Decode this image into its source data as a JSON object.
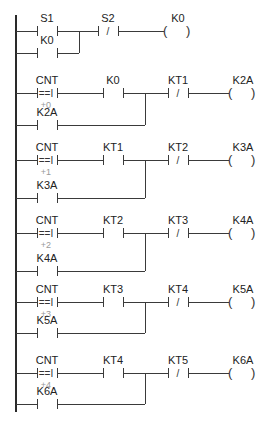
{
  "diagram": {
    "type": "ladder-logic",
    "colors": {
      "wire": "#3a3a3a",
      "text": "#222222",
      "annotation": "#9a9a9a"
    },
    "rail": {
      "x": 16,
      "y1": 15,
      "y2": 412
    },
    "rungs": [
      {
        "id": "rung-1",
        "main_y": 31,
        "branch_y": 53,
        "junction_x": 79,
        "elements": [
          {
            "kind": "contact_no",
            "label": "S1",
            "x": 37
          },
          {
            "kind": "contact_nc",
            "label": "S2",
            "x": 98
          },
          {
            "kind": "coil",
            "label": "K0",
            "x": 163
          }
        ],
        "branch": {
          "kind": "contact_no",
          "label": "K0",
          "x": 37
        }
      },
      {
        "id": "rung-2",
        "main_y": 93,
        "branch_y": 125,
        "junction_x": 145,
        "elements": [
          {
            "kind": "compare",
            "label": "CNT",
            "op": "==I",
            "operand": "+0",
            "x": 37
          },
          {
            "kind": "contact_no",
            "label": "K0",
            "x": 103
          },
          {
            "kind": "contact_nc",
            "label": "KT1",
            "x": 168
          },
          {
            "kind": "coil",
            "label": "K2A",
            "x": 228
          }
        ],
        "branch": {
          "kind": "contact_no",
          "label": "K2A",
          "x": 37
        }
      },
      {
        "id": "rung-3",
        "main_y": 160,
        "branch_y": 198,
        "junction_x": 145,
        "elements": [
          {
            "kind": "compare",
            "label": "CNT",
            "op": "==I",
            "operand": "+1",
            "x": 37
          },
          {
            "kind": "contact_no",
            "label": "KT1",
            "x": 103
          },
          {
            "kind": "contact_nc",
            "label": "KT2",
            "x": 168
          },
          {
            "kind": "coil",
            "label": "K3A",
            "x": 228
          }
        ],
        "branch": {
          "kind": "contact_no",
          "label": "K3A",
          "x": 37
        }
      },
      {
        "id": "rung-4",
        "main_y": 233,
        "branch_y": 271,
        "junction_x": 145,
        "elements": [
          {
            "kind": "compare",
            "label": "CNT",
            "op": "==I",
            "operand": "+2",
            "x": 37
          },
          {
            "kind": "contact_no",
            "label": "KT2",
            "x": 103
          },
          {
            "kind": "contact_nc",
            "label": "KT3",
            "x": 168
          },
          {
            "kind": "coil",
            "label": "K4A",
            "x": 228
          }
        ],
        "branch": {
          "kind": "contact_no",
          "label": "K4A",
          "x": 37
        }
      },
      {
        "id": "rung-5",
        "main_y": 302,
        "branch_y": 333,
        "junction_x": 145,
        "elements": [
          {
            "kind": "compare",
            "label": "CNT",
            "op": "==I",
            "operand": "+3",
            "x": 37
          },
          {
            "kind": "contact_no",
            "label": "KT3",
            "x": 103
          },
          {
            "kind": "contact_nc",
            "label": "KT4",
            "x": 168
          },
          {
            "kind": "coil",
            "label": "K5A",
            "x": 228
          }
        ],
        "branch": {
          "kind": "contact_no",
          "label": "K5A",
          "x": 37
        }
      },
      {
        "id": "rung-6",
        "main_y": 373,
        "branch_y": 404,
        "junction_x": 145,
        "elements": [
          {
            "kind": "compare",
            "label": "CNT",
            "op": "==I",
            "operand": "+4",
            "x": 37
          },
          {
            "kind": "contact_no",
            "label": "KT4",
            "x": 103
          },
          {
            "kind": "contact_nc",
            "label": "KT5",
            "x": 168
          },
          {
            "kind": "coil",
            "label": "K6A",
            "x": 228
          }
        ],
        "branch": {
          "kind": "contact_no",
          "label": "K6A",
          "x": 37
        }
      }
    ]
  }
}
